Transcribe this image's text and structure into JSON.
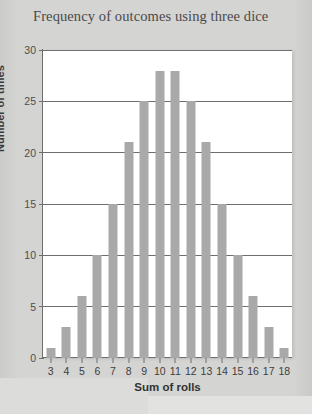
{
  "chart_data": {
    "type": "bar",
    "title": "Frequency of outcomes using three dice",
    "xlabel": "Sum of rolls",
    "ylabel": "Number of times",
    "categories": [
      "3",
      "4",
      "5",
      "6",
      "7",
      "8",
      "9",
      "10",
      "11",
      "12",
      "13",
      "14",
      "15",
      "16",
      "17",
      "18"
    ],
    "values": [
      1,
      3,
      6,
      10,
      15,
      21,
      25,
      28,
      28,
      25,
      21,
      15,
      10,
      6,
      3,
      1
    ],
    "ylim": [
      0,
      30
    ],
    "yticks": [
      "0",
      "5",
      "10",
      "15",
      "20",
      "25",
      "30"
    ],
    "ytick_values": [
      0,
      5,
      10,
      15,
      20,
      25,
      30
    ],
    "grid": true,
    "legend": false,
    "bar_color": "#a9a9a9",
    "axis_color": "#6e6e6e",
    "plot_background": "#ffffff",
    "page_background": "#d4d4d2"
  }
}
